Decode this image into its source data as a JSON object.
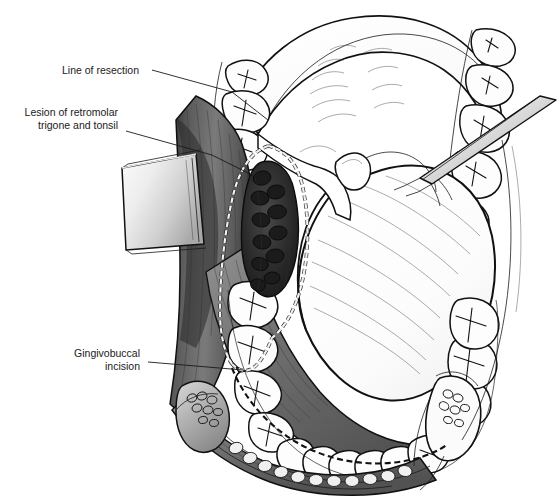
{
  "figure": {
    "domain_kind": "medical-illustration",
    "background_color": "#ffffff",
    "ink_color": "#111111"
  },
  "annotations": [
    {
      "id": "line-of-resection",
      "lines": [
        "Line of resection"
      ],
      "text_x": 62,
      "text_y": 74,
      "text_anchor": "start",
      "leader": "M 152 70 L 232 92 L 268 120"
    },
    {
      "id": "lesion-of-retromolar-trigone-and-tonsil",
      "lines": [
        "Lesion of retromolar",
        "trigone and tonsil"
      ],
      "text_x": 118,
      "text_y": 116,
      "text_anchor": "end",
      "leader": "M 126 131 L 212 155 L 258 178"
    },
    {
      "id": "gingivobuccal-incision",
      "lines": [
        "Gingivobuccal",
        "incision"
      ],
      "text_x": 140,
      "text_y": 357,
      "text_anchor": "end",
      "leader": "M 148 362 L 243 370"
    }
  ],
  "structures": {
    "hard_palate": "hard-palate",
    "soft_palate": "soft-palate",
    "uvula": "uvula",
    "tongue": "tongue",
    "maxillary_teeth_right": "maxillary-teeth-right",
    "maxillary_teeth_left": "maxillary-teeth-left",
    "mandibular_teeth": "mandibular-teeth",
    "buccal_mucosa": "buccal-mucosa",
    "retromolar_lesion": "retromolar-trigone-lesion",
    "cheek_retractor": "cheek-retractor-blade",
    "tongue_retractor": "tongue-retractor-instrument",
    "lower_lip": "lower-lip",
    "mandible_alveolar_ridge": "mandible-alveolar-ridge",
    "resection_outline": "resection-dashed-outline",
    "gingivobuccal_incision_line": "gingivobuccal-incision-dashed-line"
  },
  "palette": {
    "paper": "#ffffff",
    "ink": "#111111",
    "tooth_enamel": "#fdfdfd",
    "mucosa_dark": "#4b4b4b",
    "mucosa_mid": "#6e6e6e",
    "mucosa_light": "#9a9a9a",
    "lesion_dark": "#2a2a2a",
    "metal_light": "#f0f0f0",
    "metal_mid": "#b8b8b8",
    "tongue_fill": "#fefefe"
  }
}
